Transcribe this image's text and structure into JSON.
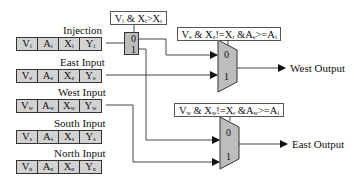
{
  "diagram": {
    "registers": [
      {
        "label": "Injection",
        "cells": [
          {
            "base": "V",
            "sub": "i"
          },
          {
            "base": "A",
            "sub": "i"
          },
          {
            "base": "X",
            "sub": "i"
          },
          {
            "base": "Y",
            "sub": "i"
          }
        ]
      },
      {
        "label": "East Input",
        "cells": [
          {
            "base": "V",
            "sub": "e"
          },
          {
            "base": "A",
            "sub": "e"
          },
          {
            "base": "X",
            "sub": "e"
          },
          {
            "base": "Y",
            "sub": "e"
          }
        ]
      },
      {
        "label": "West Input",
        "cells": [
          {
            "base": "V",
            "sub": "w"
          },
          {
            "base": "A",
            "sub": "w"
          },
          {
            "base": "X",
            "sub": "w"
          },
          {
            "base": "Y",
            "sub": "w"
          }
        ]
      },
      {
        "label": "South Input",
        "cells": [
          {
            "base": "V",
            "sub": "s"
          },
          {
            "base": "A",
            "sub": "s"
          },
          {
            "base": "X",
            "sub": "s"
          },
          {
            "base": "Y",
            "sub": "s"
          }
        ]
      },
      {
        "label": "North Input",
        "cells": [
          {
            "base": "V",
            "sub": "n"
          },
          {
            "base": "A",
            "sub": "n"
          },
          {
            "base": "X",
            "sub": "n"
          },
          {
            "base": "Y",
            "sub": "n"
          }
        ]
      }
    ],
    "demux": {
      "condition": "V_i & X_i>X_r",
      "condition_parts": [
        {
          "t": "V"
        },
        {
          "s": "i"
        },
        {
          "t": " & X"
        },
        {
          "s": "i"
        },
        {
          "t": ">X"
        },
        {
          "s": "r"
        }
      ],
      "pins": [
        "0",
        "1"
      ]
    },
    "west_mux": {
      "condition": "V_e & X_e!=X_r &A_e>=A_i",
      "condition_parts": [
        {
          "t": "V"
        },
        {
          "s": "e"
        },
        {
          "t": " & X"
        },
        {
          "s": "e"
        },
        {
          "t": "!=X"
        },
        {
          "s": "r"
        },
        {
          "t": " &A"
        },
        {
          "s": "e"
        },
        {
          "t": ">=A"
        },
        {
          "s": "i"
        }
      ],
      "pins": [
        "0",
        "1"
      ],
      "output_label": "West Output"
    },
    "east_mux": {
      "condition": "V_w & X_w!=X_r &A_w>=A_i",
      "condition_parts": [
        {
          "t": "V"
        },
        {
          "s": "w"
        },
        {
          "t": " & X"
        },
        {
          "s": "w"
        },
        {
          "t": "!=X"
        },
        {
          "s": "r"
        },
        {
          "t": " &A"
        },
        {
          "s": "w"
        },
        {
          "t": ">=A"
        },
        {
          "s": "i"
        }
      ],
      "pins": [
        "0",
        "1"
      ],
      "output_label": "East Output"
    },
    "colors": {
      "register_fill": "#d2d2d2",
      "mux_fill": "#bdbdbd",
      "line": "#333333"
    }
  }
}
